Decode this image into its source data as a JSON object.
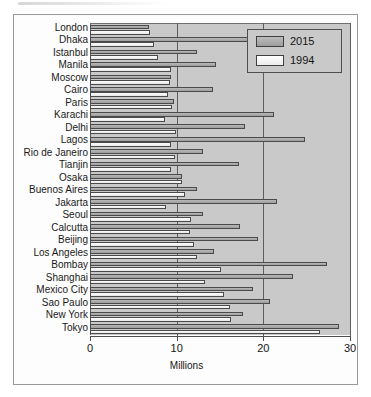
{
  "chart_data": {
    "type": "bar",
    "orientation": "horizontal",
    "title": "",
    "xlabel": "Millions",
    "ylabel": "",
    "xlim": [
      0,
      30
    ],
    "xticks": [
      "0",
      "10",
      "20",
      "30"
    ],
    "grid": true,
    "legend_position": "top-right",
    "categories": [
      "London",
      "Dhaka",
      "Istanbul",
      "Manila",
      "Moscow",
      "Cairo",
      "Paris",
      "Karachi",
      "Delhi",
      "Lagos",
      "Rio de Janeiro",
      "Tianjin",
      "Osaka",
      "Buenos Aires",
      "Jakarta",
      "Seoul",
      "Calcutta",
      "Beijing",
      "Los Angeles",
      "Bombay",
      "Shanghai",
      "Mexico City",
      "Sao Paulo",
      "New York",
      "Tokyo"
    ],
    "series": [
      {
        "name": "2015",
        "color": "#a9a9a9",
        "values": [
          6.8,
          18.5,
          12.3,
          14.5,
          9.3,
          14.2,
          9.7,
          21.2,
          17.9,
          24.8,
          13.0,
          17.2,
          10.6,
          12.4,
          21.6,
          13.0,
          17.3,
          19.4,
          14.3,
          27.4,
          23.4,
          18.8,
          20.8,
          17.6,
          28.7
        ]
      },
      {
        "name": "1994",
        "color": "#f2f2f2",
        "values": [
          6.9,
          7.4,
          7.8,
          9.3,
          9.2,
          9.0,
          9.5,
          8.7,
          9.9,
          9.4,
          9.8,
          9.3,
          10.6,
          11.0,
          8.8,
          11.6,
          11.5,
          12.0,
          12.4,
          15.1,
          13.3,
          15.5,
          16.1,
          16.3,
          26.5
        ]
      }
    ],
    "legend": [
      {
        "label": "2015",
        "swatch": "gray"
      },
      {
        "label": "1994",
        "swatch": "white"
      }
    ]
  },
  "axis": {
    "title": "Millions",
    "ticks": [
      {
        "label": "0",
        "value": 0
      },
      {
        "label": "10",
        "value": 10
      },
      {
        "label": "20",
        "value": 20
      },
      {
        "label": "30",
        "value": 30
      }
    ]
  }
}
